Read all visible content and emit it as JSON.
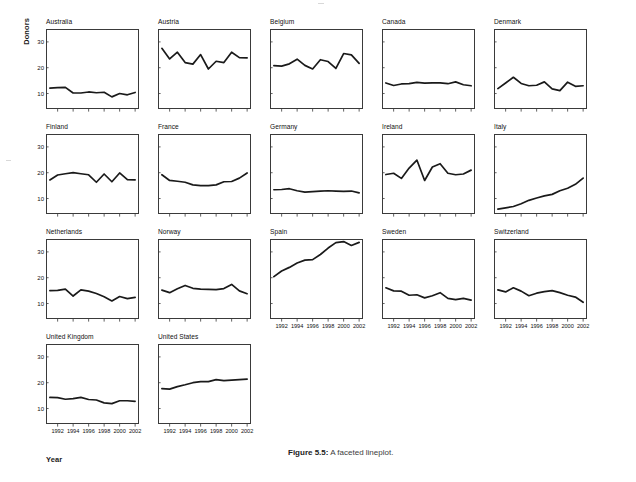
{
  "figure": {
    "caption_label": "Figure 5.5:",
    "caption_text": " A faceted lineplot.",
    "y_axis_title": "Donors",
    "x_axis_title": "Year"
  },
  "chart_data": {
    "type": "line",
    "title": "A faceted lineplot",
    "xlabel": "Year",
    "ylabel": "Donors",
    "xlim": [
      1990.5,
      2002.5
    ],
    "ylim": [
      4,
      35
    ],
    "xticks": [
      1992,
      1994,
      1996,
      1998,
      2000,
      2002
    ],
    "yticks": [
      10,
      20,
      30
    ],
    "grid": false,
    "legend": "none",
    "facet_layout": {
      "rows": 4,
      "cols": 5
    },
    "x": [
      1991,
      1992,
      1993,
      1994,
      1995,
      1996,
      1997,
      1998,
      1999,
      2000,
      2001,
      2002
    ],
    "series": [
      {
        "name": "Australia",
        "values": [
          12.1,
          12.3,
          12.4,
          10.2,
          10.2,
          10.6,
          10.3,
          10.5,
          8.7,
          10.0,
          9.5,
          10.4
        ]
      },
      {
        "name": "Austria",
        "values": [
          27.5,
          23.4,
          26.0,
          22.0,
          21.4,
          25.1,
          19.5,
          22.5,
          22.0,
          26.0,
          23.9,
          23.8
        ]
      },
      {
        "name": "Belgium",
        "values": [
          20.8,
          20.6,
          21.5,
          23.3,
          20.9,
          19.5,
          23.1,
          22.4,
          19.7,
          25.5,
          25.0,
          21.7
        ]
      },
      {
        "name": "Canada",
        "values": [
          14.1,
          13.1,
          13.7,
          13.8,
          14.3,
          14.0,
          14.1,
          14.1,
          13.8,
          14.5,
          13.4,
          13.0
        ]
      },
      {
        "name": "Denmark",
        "values": [
          11.9,
          14.1,
          16.3,
          13.9,
          13.0,
          13.2,
          14.5,
          11.8,
          11.1,
          14.4,
          12.8,
          13.0
        ]
      },
      {
        "name": "Finland",
        "values": [
          17.2,
          19.1,
          19.6,
          20.0,
          19.6,
          19.2,
          16.3,
          19.5,
          16.5,
          19.9,
          17.3,
          17.2
        ]
      },
      {
        "name": "France",
        "values": [
          19.2,
          17.0,
          16.7,
          16.3,
          15.3,
          15.0,
          15.0,
          15.3,
          16.5,
          16.6,
          17.9,
          19.9
        ]
      },
      {
        "name": "Germany",
        "values": [
          13.4,
          13.5,
          13.8,
          13.0,
          12.5,
          12.7,
          12.9,
          13.0,
          12.9,
          12.8,
          12.9,
          12.2
        ]
      },
      {
        "name": "Ireland",
        "values": [
          19.3,
          19.8,
          17.8,
          21.8,
          24.9,
          17.0,
          22.2,
          23.5,
          19.8,
          19.2,
          19.5,
          21.0
        ]
      },
      {
        "name": "Italy",
        "values": [
          5.9,
          6.4,
          6.9,
          8.0,
          9.3,
          10.2,
          11.0,
          11.6,
          13.0,
          14.0,
          15.5,
          17.9
        ]
      },
      {
        "name": "Netherlands",
        "values": [
          15.0,
          15.1,
          15.6,
          12.9,
          15.3,
          14.8,
          13.9,
          12.6,
          11.0,
          12.7,
          11.9,
          12.4
        ]
      },
      {
        "name": "Norway",
        "values": [
          15.2,
          14.2,
          15.7,
          17.0,
          15.9,
          15.6,
          15.5,
          15.4,
          15.8,
          17.4,
          14.9,
          13.8
        ]
      },
      {
        "name": "Spain",
        "values": [
          20.4,
          22.6,
          24.0,
          25.7,
          26.8,
          27.0,
          29.0,
          31.5,
          33.6,
          34.0,
          32.5,
          33.7
        ]
      },
      {
        "name": "Sweden",
        "values": [
          16.1,
          14.9,
          14.8,
          13.2,
          13.4,
          12.2,
          13.0,
          14.2,
          12.0,
          11.5,
          12.0,
          11.3
        ]
      },
      {
        "name": "Switzerland",
        "values": [
          15.3,
          14.5,
          16.1,
          14.8,
          13.0,
          14.0,
          14.6,
          15.0,
          14.2,
          13.2,
          12.5,
          10.5
        ]
      },
      {
        "name": "United Kingdom",
        "values": [
          14.3,
          14.2,
          13.6,
          13.8,
          14.3,
          13.5,
          13.3,
          12.2,
          11.9,
          13.0,
          13.0,
          12.8
        ]
      },
      {
        "name": "United States",
        "values": [
          17.7,
          17.5,
          18.5,
          19.2,
          20.0,
          20.4,
          20.4,
          21.2,
          20.8,
          21.0,
          21.2,
          21.4
        ]
      }
    ]
  },
  "panels": [
    {
      "name": "Australia",
      "row": 0,
      "col": 0,
      "show_x_labels": false
    },
    {
      "name": "Austria",
      "row": 0,
      "col": 1,
      "show_x_labels": false
    },
    {
      "name": "Belgium",
      "row": 0,
      "col": 2,
      "show_x_labels": false
    },
    {
      "name": "Canada",
      "row": 0,
      "col": 3,
      "show_x_labels": false
    },
    {
      "name": "Denmark",
      "row": 0,
      "col": 4,
      "show_x_labels": false
    },
    {
      "name": "Finland",
      "row": 1,
      "col": 0,
      "show_x_labels": false
    },
    {
      "name": "France",
      "row": 1,
      "col": 1,
      "show_x_labels": false
    },
    {
      "name": "Germany",
      "row": 1,
      "col": 2,
      "show_x_labels": false
    },
    {
      "name": "Ireland",
      "row": 1,
      "col": 3,
      "show_x_labels": false
    },
    {
      "name": "Italy",
      "row": 1,
      "col": 4,
      "show_x_labels": false
    },
    {
      "name": "Netherlands",
      "row": 2,
      "col": 0,
      "show_x_labels": false
    },
    {
      "name": "Norway",
      "row": 2,
      "col": 1,
      "show_x_labels": false
    },
    {
      "name": "Spain",
      "row": 2,
      "col": 2,
      "show_x_labels": true
    },
    {
      "name": "Sweden",
      "row": 2,
      "col": 3,
      "show_x_labels": true
    },
    {
      "name": "Switzerland",
      "row": 2,
      "col": 4,
      "show_x_labels": true
    },
    {
      "name": "United Kingdom",
      "row": 3,
      "col": 0,
      "show_x_labels": true
    },
    {
      "name": "United States",
      "row": 3,
      "col": 1,
      "show_x_labels": true
    }
  ],
  "style": {
    "line_color": "#1a1a1a",
    "frame_color": "#3a3a3a",
    "text_color": "#111111",
    "background": "#ffffff"
  }
}
